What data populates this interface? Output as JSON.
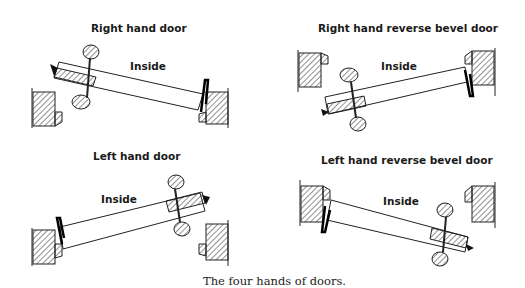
{
  "panels": [
    {
      "title": "Right hand door",
      "label": "Inside"
    },
    {
      "title": "Right hand reverse bevel door",
      "label": "Inside"
    },
    {
      "title": "Left hand door",
      "label": "Inside"
    },
    {
      "title": "Left hand reverse bevel door",
      "label": "Inside"
    }
  ],
  "caption": "The four hands of doors."
}
